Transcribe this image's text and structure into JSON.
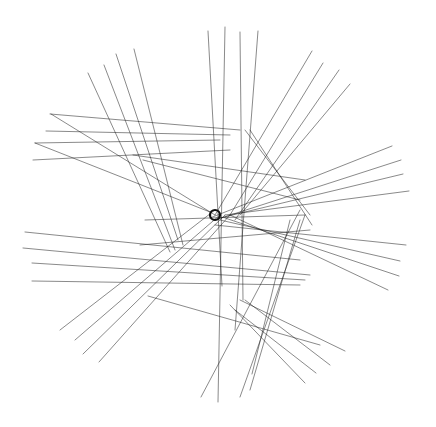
{
  "figure": {
    "type": "geometric line-art",
    "background": "#ffffff",
    "stroke_color": "#1a1a1a",
    "center": [
      215,
      215
    ],
    "lines": [
      [
        208,
        31,
        222,
        286
      ],
      [
        225,
        27,
        218,
        402
      ],
      [
        240,
        32,
        243,
        300
      ],
      [
        258,
        31,
        235,
        330
      ],
      [
        312,
        51,
        215,
        215
      ],
      [
        323,
        63,
        230,
        215
      ],
      [
        339,
        70,
        235,
        220
      ],
      [
        350,
        84,
        240,
        215
      ],
      [
        134,
        49,
        183,
        245
      ],
      [
        116,
        54,
        178,
        240
      ],
      [
        104,
        65,
        175,
        250
      ],
      [
        88,
        73,
        170,
        252
      ],
      [
        50,
        114,
        240,
        130
      ],
      [
        46,
        131,
        230,
        135
      ],
      [
        35,
        143,
        220,
        140
      ],
      [
        33,
        160,
        230,
        150
      ],
      [
        51,
        114,
        215,
        215
      ],
      [
        35,
        143,
        210,
        212
      ],
      [
        392,
        146,
        210,
        218
      ],
      [
        401,
        160,
        215,
        220
      ],
      [
        403,
        174,
        220,
        218
      ],
      [
        409,
        191,
        225,
        215
      ],
      [
        406,
        245,
        215,
        225
      ],
      [
        400,
        261,
        220,
        220
      ],
      [
        399,
        276,
        225,
        218
      ],
      [
        388,
        290,
        230,
        215
      ],
      [
        25,
        232,
        300,
        260
      ],
      [
        23,
        248,
        310,
        275
      ],
      [
        32,
        263,
        305,
        280
      ],
      [
        32,
        281,
        300,
        285
      ],
      [
        60,
        330,
        215,
        210
      ],
      [
        75,
        340,
        220,
        215
      ],
      [
        83,
        354,
        225,
        215
      ],
      [
        99,
        362,
        230,
        215
      ],
      [
        148,
        296,
        320,
        345
      ],
      [
        201,
        397,
        300,
        210
      ],
      [
        240,
        397,
        305,
        215
      ],
      [
        250,
        390,
        300,
        220
      ],
      [
        252,
        374,
        290,
        220
      ],
      [
        345,
        351,
        240,
        300
      ],
      [
        330,
        365,
        245,
        300
      ],
      [
        316,
        373,
        235,
        310
      ],
      [
        305,
        383,
        230,
        305
      ],
      [
        133,
        155,
        305,
        180
      ],
      [
        143,
        160,
        300,
        200
      ],
      [
        245,
        130,
        310,
        215
      ],
      [
        250,
        130,
        312,
        225
      ],
      [
        145,
        220,
        305,
        215
      ],
      [
        140,
        245,
        310,
        230
      ]
    ]
  }
}
